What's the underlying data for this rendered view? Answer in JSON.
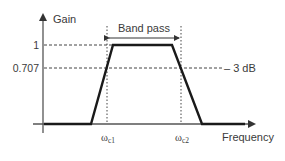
{
  "diagram": {
    "type": "band-pass filter frequency response",
    "y_axis_label": "Gain",
    "x_axis_label": "Frequency",
    "y_ticks": [
      {
        "label": "1",
        "value": 1
      },
      {
        "label": "0.707",
        "value": 0.707
      }
    ],
    "x_ticks": [
      {
        "label": "ω",
        "sub": "c1"
      },
      {
        "label": "ω",
        "sub": "c2"
      }
    ],
    "band_label": "Band pass",
    "db_annotation": "– 3 dB",
    "colors": {
      "curve": "#1a1a1a",
      "axis": "#555555",
      "guides": "#444444",
      "text": "#3a3a3a"
    }
  }
}
